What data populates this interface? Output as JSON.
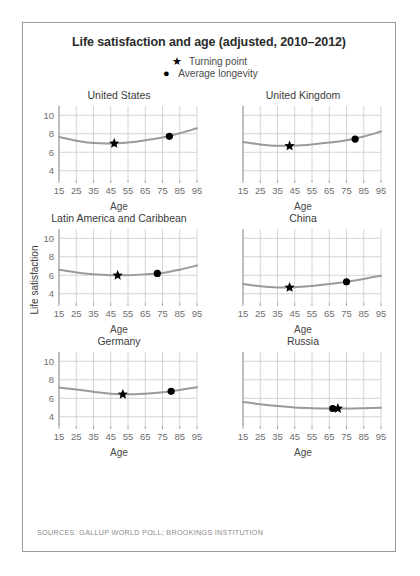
{
  "title": "Life satisfaction and age (adjusted, 2010–2012)",
  "legend": [
    {
      "marker": "star-icon",
      "glyph": "★",
      "label": "Turning point"
    },
    {
      "marker": "circle-icon",
      "glyph": "●",
      "label": "Average longevity"
    }
  ],
  "axis_label_y": "Life satisfaction",
  "axis_label_x": "Age",
  "source": "SOURCES: GALLUP WORLD POLL; BROOKINGS INSTITUTION",
  "colors": {
    "curve": "#9a9a9a",
    "marker": "#000000",
    "grid": "#c9c9c9",
    "axis": "#8a8a8a",
    "text": "#3a3a3a",
    "border": "#9a9a9a"
  },
  "chart_data": {
    "type": "line",
    "title": "Life satisfaction and age (adjusted, 2010–2012)",
    "xlabel": "Age",
    "ylabel": "Life satisfaction",
    "xlim": [
      15,
      95
    ],
    "ylim": [
      3,
      11
    ],
    "xticks": [
      15,
      25,
      35,
      45,
      55,
      65,
      75,
      85,
      95
    ],
    "yticks": [
      4,
      6,
      8,
      10
    ],
    "grid": true,
    "legend_position": "top-center",
    "panels": [
      {
        "name": "United States",
        "show_yticks": true,
        "x": [
          15,
          25,
          35,
          45,
          55,
          65,
          75,
          85,
          95
        ],
        "values": [
          7.65,
          7.25,
          7.0,
          6.95,
          7.05,
          7.3,
          7.6,
          8.05,
          8.6
        ],
        "turning_point": {
          "age": 47,
          "value": 6.95
        },
        "average_longevity": {
          "age": 79,
          "value": 7.72
        }
      },
      {
        "name": "United Kingdom",
        "show_yticks": false,
        "x": [
          15,
          25,
          35,
          45,
          55,
          65,
          75,
          85,
          95
        ],
        "values": [
          7.1,
          6.85,
          6.7,
          6.72,
          6.85,
          7.05,
          7.3,
          7.7,
          8.25
        ],
        "turning_point": {
          "age": 42,
          "value": 6.68
        },
        "average_longevity": {
          "age": 80,
          "value": 7.42
        }
      },
      {
        "name": "Latin America and Caribbean",
        "show_yticks": true,
        "x": [
          15,
          25,
          35,
          45,
          55,
          65,
          75,
          85,
          95
        ],
        "values": [
          6.6,
          6.3,
          6.1,
          6.0,
          6.0,
          6.1,
          6.25,
          6.6,
          7.05
        ],
        "turning_point": {
          "age": 49,
          "value": 5.98
        },
        "average_longevity": {
          "age": 72,
          "value": 6.2
        }
      },
      {
        "name": "China",
        "show_yticks": false,
        "x": [
          15,
          25,
          35,
          45,
          55,
          65,
          75,
          85,
          95
        ],
        "values": [
          5.05,
          4.8,
          4.68,
          4.7,
          4.85,
          5.05,
          5.3,
          5.6,
          5.95
        ],
        "turning_point": {
          "age": 42,
          "value": 4.68
        },
        "average_longevity": {
          "age": 75,
          "value": 5.3
        }
      },
      {
        "name": "Germany",
        "show_yticks": true,
        "x": [
          15,
          25,
          35,
          45,
          55,
          65,
          75,
          85,
          95
        ],
        "values": [
          7.15,
          6.95,
          6.7,
          6.5,
          6.42,
          6.5,
          6.65,
          6.9,
          7.2
        ],
        "turning_point": {
          "age": 52,
          "value": 6.42
        },
        "average_longevity": {
          "age": 80,
          "value": 6.75
        }
      },
      {
        "name": "Russia",
        "show_yticks": false,
        "x": [
          15,
          25,
          35,
          45,
          55,
          65,
          75,
          85,
          95
        ],
        "values": [
          5.6,
          5.35,
          5.15,
          5.0,
          4.92,
          4.88,
          4.88,
          4.92,
          4.98
        ],
        "turning_point": {
          "age": 70,
          "value": 4.89
        },
        "average_longevity": {
          "age": 67,
          "value": 4.89
        }
      }
    ]
  }
}
